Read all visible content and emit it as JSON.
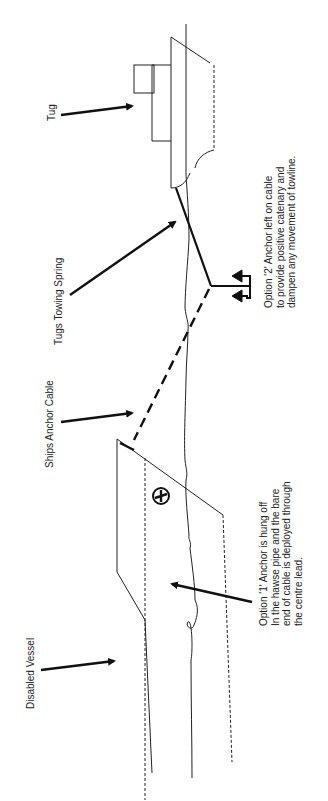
{
  "diagram": {
    "orientation": "rotated -90deg (landscape drawing shown in portrait)",
    "labels": {
      "tug": "Tug",
      "tugs_towing_spring": "Tugs Towing Spring",
      "ships_anchor_cable": "Ships Anchor Cable",
      "disabled_vessel": "Disabled Vessel"
    },
    "notes": {
      "option_2": [
        "Option '2' Anchor left on cable",
        "to provide positive catenary and",
        "dampen any movement of towline."
      ],
      "option_1": [
        "Option '1' Anchor is hung off",
        "In the hawse pipe and the bare",
        "end of cable is deployed through",
        "the centre lead."
      ]
    },
    "elements": [
      {
        "name": "tug",
        "kind": "vessel"
      },
      {
        "name": "disabled-vessel",
        "kind": "vessel"
      },
      {
        "name": "tugs-towing-spring",
        "kind": "line",
        "style": "solid"
      },
      {
        "name": "ships-anchor-cable",
        "kind": "line",
        "style": "dashed"
      },
      {
        "name": "anchor-option-2",
        "kind": "anchor"
      },
      {
        "name": "hawse-pipe-anchor-option-1",
        "kind": "anchor"
      }
    ],
    "colors": {
      "ink": "#1a1a1a",
      "background": "#ffffff"
    }
  }
}
